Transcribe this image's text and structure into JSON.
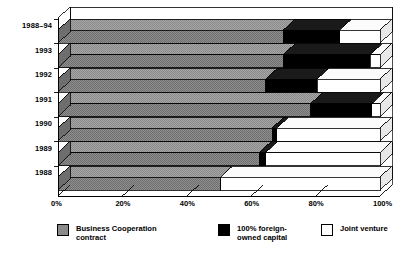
{
  "chart_data": {
    "type": "bar",
    "orientation": "horizontal",
    "stacked": true,
    "percent_stacked": true,
    "three_d": true,
    "title": "",
    "subtitle": "",
    "xlabel": "",
    "ylabel": "",
    "xlim": [
      0,
      100
    ],
    "xtick_labels": [
      "0%",
      "20%",
      "40%",
      "60%",
      "80%",
      "100%"
    ],
    "xticks": [
      0,
      20,
      40,
      60,
      80,
      100
    ],
    "grid": true,
    "legend_position": "bottom",
    "categories": [
      "1988–94",
      "1993",
      "1992",
      "1991",
      "1990",
      "1989",
      "1988"
    ],
    "series": [
      {
        "name": "Business Cooperation contract",
        "color": "#8a8a8a",
        "values": [
          70,
          70,
          64.5,
          78.5,
          66.5,
          62.5,
          50.5
        ]
      },
      {
        "name": "100% foreign-owned capital",
        "color": "#000000",
        "values": [
          17.5,
          27,
          16,
          19,
          1.5,
          2,
          0
        ]
      },
      {
        "name": "Joint venture",
        "color": "#ffffff",
        "values": [
          12.5,
          3,
          19.5,
          2.5,
          32,
          35.5,
          49.5
        ]
      }
    ]
  },
  "axis": {
    "y_labels": [
      "1988–94",
      "1993",
      "1992",
      "1991",
      "1990",
      "1989",
      "1988"
    ],
    "x_labels": [
      "0%",
      "20%",
      "40%",
      "60%",
      "80%",
      "100%"
    ]
  },
  "legend": {
    "items": [
      {
        "label": "Business Cooperation\ncontract",
        "swatch": "gray"
      },
      {
        "label": "100% foreign-\nowned capital",
        "swatch": "black"
      },
      {
        "label": "Joint venture",
        "swatch": "white"
      }
    ]
  },
  "colors": {
    "series_gray": "#8a8a8a",
    "series_black": "#000000",
    "series_white": "#ffffff",
    "outline": "#000000",
    "background": "#ffffff"
  }
}
